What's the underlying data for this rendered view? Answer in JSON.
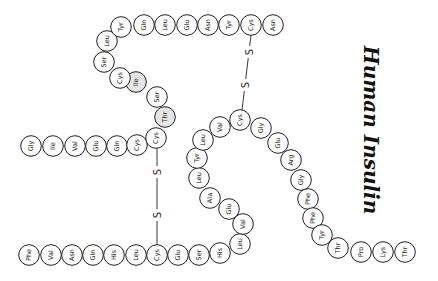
{
  "title": "Human Insulin",
  "colors": {
    "stroke": "#222222",
    "background": "#ffffff",
    "shaded_fill": "#d8d8d8"
  },
  "a_chain": {
    "label": "A chain",
    "residues": [
      {
        "name": "Gly",
        "x": 31,
        "y": 146
      },
      {
        "name": "Ile",
        "x": 53,
        "y": 146
      },
      {
        "name": "Val",
        "x": 75,
        "y": 146
      },
      {
        "name": "Glu",
        "x": 96,
        "y": 146
      },
      {
        "name": "Gln",
        "x": 117,
        "y": 146
      },
      {
        "name": "Cys",
        "x": 137,
        "y": 145
      },
      {
        "name": "Cys",
        "x": 156,
        "y": 138
      },
      {
        "name": "Thr",
        "x": 165,
        "y": 117,
        "shaded": true
      },
      {
        "name": "Ser",
        "x": 157,
        "y": 97
      },
      {
        "name": "Ile",
        "x": 136,
        "y": 82,
        "shaded": true
      },
      {
        "name": "Cys",
        "x": 120,
        "y": 78
      },
      {
        "name": "Ser",
        "x": 104,
        "y": 62
      },
      {
        "name": "Leu",
        "x": 107,
        "y": 41
      },
      {
        "name": "Tyr",
        "x": 121,
        "y": 27
      },
      {
        "name": "Gln",
        "x": 144,
        "y": 25
      },
      {
        "name": "Leu",
        "x": 165,
        "y": 25
      },
      {
        "name": "Glu",
        "x": 187,
        "y": 25
      },
      {
        "name": "Asn",
        "x": 208,
        "y": 25
      },
      {
        "name": "Tyr",
        "x": 229,
        "y": 25
      },
      {
        "name": "Cys",
        "x": 251,
        "y": 25
      },
      {
        "name": "Asn",
        "x": 273,
        "y": 25
      }
    ]
  },
  "b_chain": {
    "label": "B chain",
    "residues": [
      {
        "name": "Phe",
        "x": 29,
        "y": 255
      },
      {
        "name": "Val",
        "x": 51,
        "y": 255
      },
      {
        "name": "Asn",
        "x": 72,
        "y": 255
      },
      {
        "name": "Gln",
        "x": 93,
        "y": 255
      },
      {
        "name": "His",
        "x": 114,
        "y": 255
      },
      {
        "name": "Leu",
        "x": 136,
        "y": 255
      },
      {
        "name": "Cys",
        "x": 157,
        "y": 255
      },
      {
        "name": "Glu",
        "x": 178,
        "y": 255
      },
      {
        "name": "Ser",
        "x": 199,
        "y": 255
      },
      {
        "name": "His",
        "x": 220,
        "y": 253
      },
      {
        "name": "Leu",
        "x": 240,
        "y": 244
      },
      {
        "name": "Val",
        "x": 243,
        "y": 224
      },
      {
        "name": "Glu",
        "x": 229,
        "y": 209
      },
      {
        "name": "Ala",
        "x": 210,
        "y": 198
      },
      {
        "name": "Leu",
        "x": 199,
        "y": 178
      },
      {
        "name": "Tyr",
        "x": 197,
        "y": 158
      },
      {
        "name": "Leu",
        "x": 203,
        "y": 140
      },
      {
        "name": "Val",
        "x": 220,
        "y": 127
      },
      {
        "name": "Cys",
        "x": 240,
        "y": 120
      },
      {
        "name": "Gly",
        "x": 261,
        "y": 128
      },
      {
        "name": "Glu",
        "x": 278,
        "y": 143
      },
      {
        "name": "Arg",
        "x": 291,
        "y": 160
      },
      {
        "name": "Gly",
        "x": 301,
        "y": 180
      },
      {
        "name": "Phe",
        "x": 308,
        "y": 199
      },
      {
        "name": "Phe",
        "x": 313,
        "y": 218
      },
      {
        "name": "Tyr",
        "x": 322,
        "y": 235
      },
      {
        "name": "Thr",
        "x": 338,
        "y": 248
      },
      {
        "name": "Pro",
        "x": 361,
        "y": 252
      },
      {
        "name": "Lys",
        "x": 383,
        "y": 252
      },
      {
        "name": "Thr",
        "x": 405,
        "y": 252
      }
    ]
  },
  "disulfide_bonds": [
    {
      "label": "S—S",
      "from": "A Cys (156,138)",
      "to": "B Cys (157,255)",
      "x1": 157,
      "y1": 148,
      "x2": 157,
      "y2": 245,
      "s1": {
        "x": 157,
        "y": 172
      },
      "s2": {
        "x": 157,
        "y": 215
      }
    },
    {
      "label": "S—S",
      "from": "A Cys (251,25)",
      "to": "B Cys (240,120)",
      "x1": 251,
      "y1": 35,
      "x2": 242,
      "y2": 110,
      "s1": {
        "x": 249,
        "y": 52
      },
      "s2": {
        "x": 245,
        "y": 85
      }
    }
  ],
  "s_label": "S"
}
